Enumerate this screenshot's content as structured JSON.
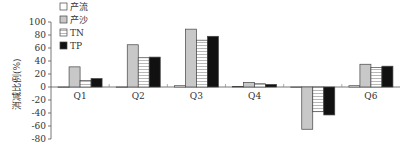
{
  "chart_data": {
    "type": "bar",
    "title": "",
    "xlabel": "",
    "ylabel": "消减比例(%)",
    "ylim": [
      -80,
      100
    ],
    "yticks": [
      100,
      80,
      60,
      40,
      20,
      0,
      -20,
      -40,
      -60,
      -80
    ],
    "categories": [
      "Q1",
      "Q2",
      "Q3",
      "Q4",
      "Q5",
      "Q6"
    ],
    "series": [
      {
        "name": "产流",
        "values": [
          0,
          0,
          2,
          1,
          0,
          2
        ],
        "fill": "#ffffff",
        "pattern": "none"
      },
      {
        "name": "产沙",
        "values": [
          31,
          65,
          89,
          7,
          -65,
          35
        ],
        "fill": "#c8c8c8",
        "pattern": "solid"
      },
      {
        "name": "TN",
        "values": [
          10,
          45,
          72,
          5,
          -38,
          30
        ],
        "fill": "#ffffff",
        "pattern": "hlines"
      },
      {
        "name": "TP",
        "values": [
          13,
          46,
          78,
          4,
          -43,
          32
        ],
        "fill": "#111111",
        "pattern": "solid"
      }
    ],
    "legend_position": "top-left",
    "grid": false
  }
}
